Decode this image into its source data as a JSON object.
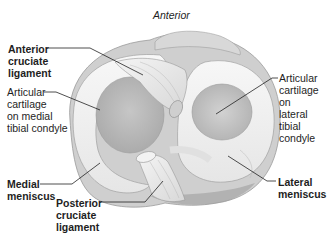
{
  "diagram": {
    "orientation_label": "Anterior",
    "labels": {
      "acl": [
        "Anterior",
        "cruciate",
        "ligament"
      ],
      "medial_cartilage": [
        "Articular",
        "cartilage",
        "on medial",
        "tibial condyle"
      ],
      "lateral_cartilage": [
        "Articular",
        "cartilage on",
        "lateral tibial",
        "condyle"
      ],
      "medial_meniscus": [
        "Medial",
        "meniscus"
      ],
      "pcl": [
        "Posterior",
        "cruciate",
        "ligament"
      ],
      "lateral_meniscus": [
        "Lateral",
        "meniscus"
      ]
    },
    "colors": {
      "background": "#ffffff",
      "meniscus": "#f1f1f1",
      "meniscus_shade": "#d9d9d9",
      "cartilage": "#bdbdbd",
      "ligament": "#e9e9e9",
      "bone_rim": "#a8a8a8",
      "leader_line": "#222222"
    }
  }
}
